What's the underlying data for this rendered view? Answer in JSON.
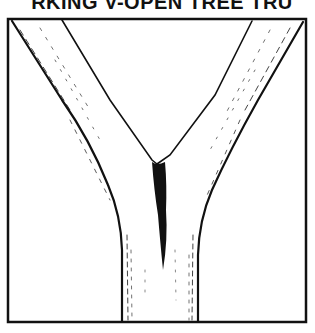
{
  "title": "RKING V-OPEN TREE TRU",
  "figure": {
    "colors": {
      "ink": "#111111",
      "paper": "#ffffff"
    }
  }
}
